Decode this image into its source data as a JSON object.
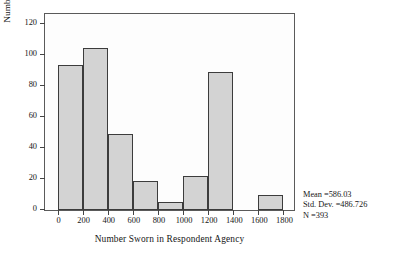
{
  "chart_data": {
    "type": "bar",
    "chart_subtype": "histogram",
    "title": "",
    "xlabel": "Number Sworn in Respondent Agency",
    "ylabel": "Number of Respondents",
    "xlim": [
      -100,
      1900
    ],
    "ylim": [
      0,
      128
    ],
    "xticks": [
      0,
      200,
      400,
      600,
      800,
      1000,
      1200,
      1400,
      1600,
      1800
    ],
    "xtick_labels": [
      "0",
      "200",
      "400",
      "600",
      "800",
      "1000",
      "1200",
      "1400",
      "1600",
      "1800"
    ],
    "yticks": [
      0,
      20,
      40,
      60,
      80,
      100,
      120
    ],
    "ytick_labels": [
      "0",
      "20",
      "40",
      "60",
      "80",
      "100",
      "120"
    ],
    "grid": false,
    "legend": false,
    "bin_width": 200,
    "bins": [
      {
        "start": 0,
        "end": 200,
        "label": "0-200",
        "value": 94
      },
      {
        "start": 200,
        "end": 400,
        "label": "200-400",
        "value": 105
      },
      {
        "start": 400,
        "end": 600,
        "label": "400-600",
        "value": 49
      },
      {
        "start": 600,
        "end": 800,
        "label": "600-800",
        "value": 19
      },
      {
        "start": 800,
        "end": 1000,
        "label": "800-1000",
        "value": 5
      },
      {
        "start": 1000,
        "end": 1200,
        "label": "1000-1200",
        "value": 22
      },
      {
        "start": 1200,
        "end": 1400,
        "label": "1200-1400",
        "value": 89
      },
      {
        "start": 1400,
        "end": 1600,
        "label": "1400-1600",
        "value": 0
      },
      {
        "start": 1600,
        "end": 1800,
        "label": "1600-1800",
        "value": 10
      }
    ],
    "categories": [
      "0-200",
      "200-400",
      "400-600",
      "600-800",
      "800-1000",
      "1000-1200",
      "1200-1400",
      "1400-1600",
      "1600-1800"
    ],
    "values": [
      94,
      105,
      49,
      19,
      5,
      22,
      89,
      0,
      10
    ],
    "bar_fill_color": "#d3d3d3",
    "bar_edge_color": "#3c3c3c",
    "plot_background": "#fdfdfd",
    "frame_color": "#5a5a5a",
    "annotations": {
      "mean_label": "Mean =586.03",
      "std_dev_label": "Std. Dev. =486.726",
      "n_label": "N =393"
    }
  },
  "stats": {
    "mean": "Mean =586.03",
    "std_dev": "Std. Dev. =486.726",
    "n": "N =393"
  },
  "axes": {
    "x_title": "Number Sworn in Respondent Agency",
    "y_title": "Number of Respondents"
  }
}
